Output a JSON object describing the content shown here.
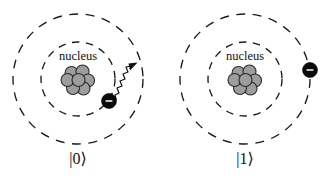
{
  "figure": {
    "background_color": "#ffffff",
    "width": 334,
    "height": 178,
    "panels": [
      {
        "id": "state-zero",
        "ket_label": "|0⟩",
        "nucleus_label": "nucleus",
        "center": {
          "x": 78,
          "y": 79
        },
        "orbits": [
          {
            "name": "ground-state-orbit",
            "radius": 37,
            "style": "dashed"
          },
          {
            "name": "excited-state-orbit",
            "radius": 65,
            "style": "dashed"
          }
        ],
        "nucleus": {
          "color": "#9d9d9d",
          "outline_color": "#2b2b2b",
          "nucleon_count": 7,
          "nucleon_radius": 6.5,
          "nucleons": [
            {
              "x": -6.5,
              "y": -6.0
            },
            {
              "x": 4.5,
              "y": -7.5
            },
            {
              "x": 10.0,
              "y": 1.5
            },
            {
              "x": 5.5,
              "y": 9.5
            },
            {
              "x": -5.0,
              "y": 9.0
            },
            {
              "x": -10.5,
              "y": 1.0
            },
            {
              "x": 0.5,
              "y": 1.0
            }
          ]
        },
        "electron": {
          "label": "electron",
          "charge_sign": "−",
          "color": "#0a0a0a",
          "radius": 7.5,
          "x": 31,
          "y": 22,
          "on_orbit": "ground-state-orbit"
        },
        "photon": {
          "label": "emitted-photon",
          "shown": true,
          "direction": "up-right",
          "color": "#111111"
        }
      },
      {
        "id": "state-one",
        "ket_label": "|1⟩",
        "nucleus_label": "nucleus",
        "center": {
          "x": 78,
          "y": 79
        },
        "orbits": [
          {
            "name": "ground-state-orbit",
            "radius": 37,
            "style": "dashed"
          },
          {
            "name": "excited-state-orbit",
            "radius": 65,
            "style": "dashed"
          }
        ],
        "nucleus": {
          "color": "#9d9d9d",
          "outline_color": "#2b2b2b",
          "nucleon_count": 7,
          "nucleon_radius": 6.5,
          "nucleons": [
            {
              "x": -6.5,
              "y": -6.0
            },
            {
              "x": 4.5,
              "y": -7.5
            },
            {
              "x": 10.0,
              "y": 1.5
            },
            {
              "x": 5.5,
              "y": 9.5
            },
            {
              "x": -5.0,
              "y": 9.0
            },
            {
              "x": -10.5,
              "y": 1.0
            },
            {
              "x": 0.5,
              "y": 1.0
            }
          ]
        },
        "electron": {
          "label": "electron",
          "charge_sign": "−",
          "color": "#0a0a0a",
          "radius": 7.5,
          "x": 65,
          "y": -9,
          "on_orbit": "excited-state-orbit"
        },
        "photon": {
          "label": "emitted-photon",
          "shown": false,
          "direction": "",
          "color": "#111111"
        }
      }
    ]
  }
}
